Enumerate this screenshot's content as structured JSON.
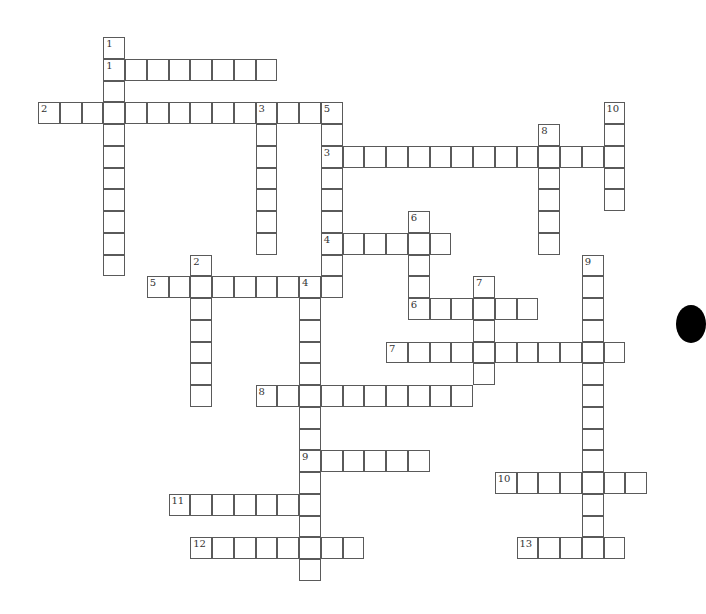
{
  "puzzle": {
    "origin": {
      "x": 38,
      "y": 37
    },
    "cell_size": 21.75,
    "colors": {
      "border": "#5a5a5a",
      "cell": "#ffffff",
      "number": "#333333",
      "marker": "#000000"
    },
    "across": [
      {
        "number": "1",
        "col": 3,
        "row": 1,
        "length": 8
      },
      {
        "number": "2",
        "col": 0,
        "row": 3,
        "length": 14
      },
      {
        "number": "3",
        "col": 13,
        "row": 5,
        "length": 14
      },
      {
        "number": "4",
        "col": 13,
        "row": 9,
        "length": 6
      },
      {
        "number": "5",
        "col": 5,
        "row": 11,
        "length": 9
      },
      {
        "number": "6",
        "col": 17,
        "row": 12,
        "length": 6
      },
      {
        "number": "7",
        "col": 16,
        "row": 14,
        "length": 11
      },
      {
        "number": "8",
        "col": 10,
        "row": 16,
        "length": 10
      },
      {
        "number": "9",
        "col": 12,
        "row": 19,
        "length": 6
      },
      {
        "number": "10",
        "col": 21,
        "row": 20,
        "length": 7
      },
      {
        "number": "11",
        "col": 6,
        "row": 21,
        "length": 7
      },
      {
        "number": "12",
        "col": 7,
        "row": 23,
        "length": 8
      },
      {
        "number": "13",
        "col": 22,
        "row": 23,
        "length": 5
      }
    ],
    "down": [
      {
        "number": "1",
        "col": 3,
        "row": 0,
        "length": 11
      },
      {
        "number": "2",
        "col": 7,
        "row": 10,
        "length": 7
      },
      {
        "number": "3",
        "col": 10,
        "row": 3,
        "length": 7
      },
      {
        "number": "4",
        "col": 12,
        "row": 11,
        "length": 14
      },
      {
        "number": "5",
        "col": 13,
        "row": 3,
        "length": 9
      },
      {
        "number": "6",
        "col": 17,
        "row": 8,
        "length": 5
      },
      {
        "number": "7",
        "col": 20,
        "row": 11,
        "length": 5
      },
      {
        "number": "8",
        "col": 23,
        "row": 4,
        "length": 6
      },
      {
        "number": "9",
        "col": 25,
        "row": 10,
        "length": 14
      },
      {
        "number": "10",
        "col": 26,
        "row": 3,
        "length": 5
      }
    ]
  }
}
